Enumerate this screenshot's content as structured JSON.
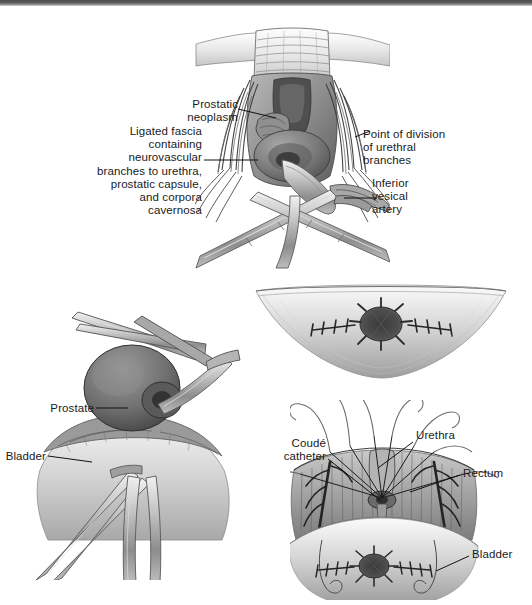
{
  "figure": {
    "background_color": "#ffffff",
    "ink_color": "#1a1a1a",
    "top_band_color": "#5c5c5c"
  },
  "panels": {
    "top": {
      "name": "apical dissection with prostatic neoplasm",
      "labels": {
        "prostatic_neoplasm": "Prostatic\nneoplasm",
        "ligated_fascia": "Ligated fascia\ncontaining\nneurovascular\nbranches to urethra,\nprostatic capsule,\nand corpora\ncavernosa",
        "point_of_division": "Point of division\nof urethral\nbranches",
        "inferior_vesical_artery": "Inferior\nvesical\nartery"
      }
    },
    "middle_right": {
      "name": "bladder neck with everted mucosa and sutures",
      "labels": {}
    },
    "bottom_left": {
      "name": "prostate and bladder with clamps",
      "labels": {
        "prostate": "Prostate",
        "bladder": "Bladder"
      }
    },
    "bottom_right": {
      "name": "urethral anastomosis with coude catheter",
      "labels": {
        "coude_catheter": "Coudé\ncatheter",
        "urethra": "Urethra",
        "rectum": "Rectum",
        "bladder": "Bladder"
      }
    }
  }
}
